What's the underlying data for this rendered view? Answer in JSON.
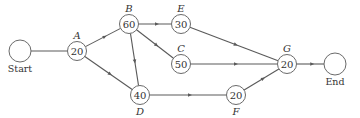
{
  "diagram": {
    "type": "activity-network",
    "nodes": [
      {
        "id": "start",
        "label": "Start",
        "value": "",
        "x": 20,
        "y": 51,
        "r": 11,
        "label_pos": "below",
        "kind": "terminal"
      },
      {
        "id": "A",
        "label": "A",
        "value": "20",
        "x": 77,
        "y": 51,
        "r": 9.5,
        "label_pos": "above",
        "kind": "task"
      },
      {
        "id": "B",
        "label": "B",
        "value": "60",
        "x": 129,
        "y": 24,
        "r": 9.5,
        "label_pos": "above",
        "kind": "task"
      },
      {
        "id": "E",
        "label": "E",
        "value": "30",
        "x": 181,
        "y": 24,
        "r": 9.5,
        "label_pos": "above",
        "kind": "task"
      },
      {
        "id": "C",
        "label": "C",
        "value": "50",
        "x": 181,
        "y": 64,
        "r": 9.5,
        "label_pos": "above",
        "kind": "task"
      },
      {
        "id": "D",
        "label": "D",
        "value": "40",
        "x": 140,
        "y": 95,
        "r": 9.5,
        "label_pos": "below",
        "kind": "task"
      },
      {
        "id": "F",
        "label": "F",
        "value": "20",
        "x": 236,
        "y": 95,
        "r": 9.5,
        "label_pos": "below",
        "kind": "task"
      },
      {
        "id": "G",
        "label": "G",
        "value": "20",
        "x": 287,
        "y": 64,
        "r": 9.5,
        "label_pos": "above",
        "kind": "task"
      },
      {
        "id": "end",
        "label": "End",
        "value": "",
        "x": 335,
        "y": 64,
        "r": 11,
        "label_pos": "below",
        "kind": "terminal"
      }
    ],
    "edges": [
      {
        "from": "start",
        "to": "A",
        "arrow": false
      },
      {
        "from": "A",
        "to": "B",
        "arrow": true
      },
      {
        "from": "A",
        "to": "D",
        "arrow": true
      },
      {
        "from": "B",
        "to": "E",
        "arrow": true
      },
      {
        "from": "B",
        "to": "C",
        "arrow": true
      },
      {
        "from": "B",
        "to": "D",
        "arrow": true
      },
      {
        "from": "E",
        "to": "G",
        "arrow": true
      },
      {
        "from": "C",
        "to": "G",
        "arrow": true
      },
      {
        "from": "D",
        "to": "F",
        "arrow": true
      },
      {
        "from": "F",
        "to": "G",
        "arrow": true
      },
      {
        "from": "G",
        "to": "end",
        "arrow": true
      }
    ]
  }
}
